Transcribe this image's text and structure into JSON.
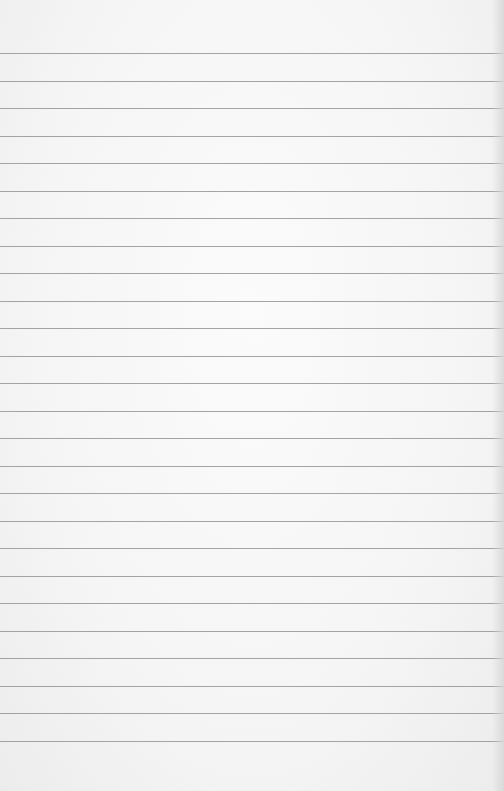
{
  "image": {
    "subject": "lined notebook paper",
    "background_color": "#f6f6f6",
    "line_color": "#8e8e8e",
    "line_count": 26,
    "first_line_y": 53,
    "line_spacing": 27.5,
    "text": ""
  }
}
